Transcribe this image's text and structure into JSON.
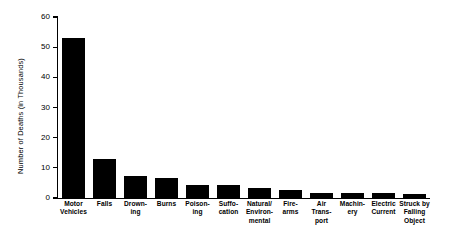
{
  "chart_data": {
    "type": "bar",
    "title": "",
    "xlabel": "",
    "ylabel": "Number of Deaths (in Thousands)",
    "ylim": [
      0,
      60
    ],
    "yticks": [
      0,
      10,
      20,
      30,
      40,
      50,
      60
    ],
    "ytick_labels": [
      "0",
      "10",
      "20",
      "30",
      "40",
      "50",
      "60"
    ],
    "grid": false,
    "legend": null,
    "bar_color": "#000000",
    "categories": [
      "Motor Vehicles",
      "Falls",
      "Drowning",
      "Burns",
      "Poisoning",
      "Suffocation",
      "Natural/Environmental",
      "Firearms",
      "Air Transport",
      "Machinery",
      "Electric Current",
      "Struck by Falling Object"
    ],
    "category_lines": [
      [
        "Motor",
        "Vehicles"
      ],
      [
        "Falls"
      ],
      [
        "Drown-",
        "ing"
      ],
      [
        "Burns"
      ],
      [
        "Poison-",
        "ing"
      ],
      [
        "Suffo-",
        "cation"
      ],
      [
        "Natural/",
        "Environ-",
        "mental"
      ],
      [
        "Fire-",
        "arms"
      ],
      [
        "Air",
        "Trans-",
        "port"
      ],
      [
        "Machin-",
        "ery"
      ],
      [
        "Electric",
        "Current"
      ],
      [
        "Struck by",
        "Falling",
        "Object"
      ]
    ],
    "values": [
      53,
      13,
      7.3,
      6.6,
      4.3,
      4.3,
      3.3,
      2.6,
      1.7,
      1.6,
      1.5,
      1.4
    ]
  }
}
